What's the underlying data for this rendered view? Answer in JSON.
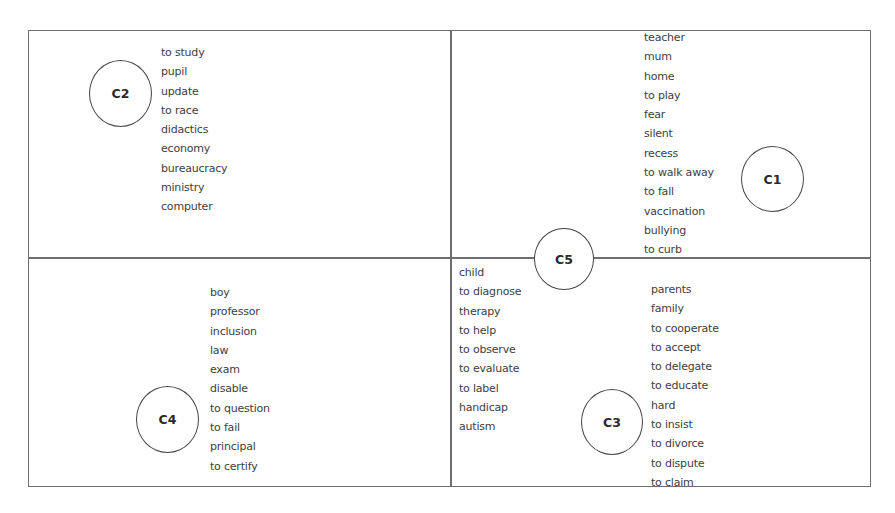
{
  "diagram": {
    "type": "cluster-quadrant-diagram",
    "colors": {
      "border": "#6e6e6e",
      "circle_border": "#444444",
      "text": "#3e3e3e",
      "background": "#ffffff"
    },
    "clusters": {
      "c1": {
        "label": "C1",
        "quadrant": "top-right",
        "words": [
          "teacher",
          "mum",
          "home",
          "to play",
          "fear",
          "silent",
          "recess",
          "to walk away",
          "to fall",
          "vaccination",
          "bullying",
          "to curb"
        ]
      },
      "c2": {
        "label": "C2",
        "quadrant": "top-left",
        "words": [
          "to study",
          "pupil",
          "update",
          "to race",
          "didactics",
          "economy",
          "bureaucracy",
          "ministry",
          "computer"
        ]
      },
      "c3": {
        "label": "C3",
        "quadrant": "bottom-right",
        "words": [
          "parents",
          "family",
          "to cooperate",
          "to accept",
          "to delegate",
          "to educate",
          "hard",
          "to insist",
          "to divorce",
          "to dispute",
          "to claim"
        ]
      },
      "c4": {
        "label": "C4",
        "quadrant": "bottom-left",
        "words": [
          "boy",
          "professor",
          "inclusion",
          "law",
          "exam",
          "disable",
          "to question",
          "to fail",
          "principal",
          "to certify"
        ]
      },
      "c5": {
        "label": "C5",
        "quadrant": "center",
        "words": [
          "child",
          "to diagnose",
          "therapy",
          "to help",
          "to observe",
          "to evaluate",
          "to label",
          "handicap",
          "autism"
        ]
      }
    }
  }
}
